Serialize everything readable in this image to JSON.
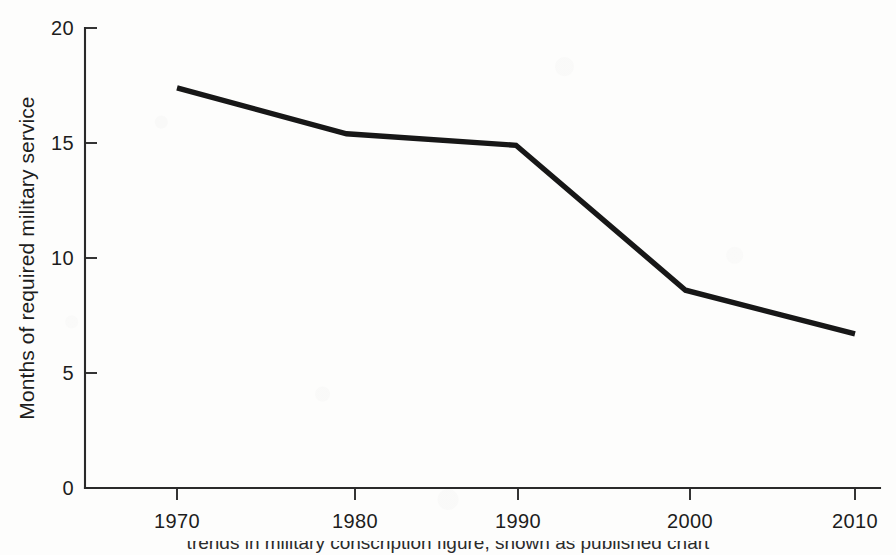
{
  "chart_data": {
    "type": "line",
    "title": "",
    "xlabel": "",
    "ylabel": "Months of required military service",
    "x": [
      1970,
      1980,
      1990,
      2000,
      2010
    ],
    "values": [
      17.4,
      15.4,
      14.9,
      8.6,
      6.7
    ],
    "categories": [
      "1970",
      "1980",
      "1990",
      "2000",
      "2010"
    ],
    "xtick_labels": [
      "1970",
      "1980",
      "1990",
      "2000",
      "2010"
    ],
    "ytick_labels": [
      "0",
      "5",
      "10",
      "15",
      "20"
    ],
    "ytick_values": [
      0,
      5,
      10,
      15,
      20
    ],
    "xlim": [
      1965,
      2015
    ],
    "ylim": [
      0,
      20
    ],
    "grid": false,
    "legend": false,
    "legend_position": "none",
    "line_color": "#171717",
    "axis_color": "#2a2a2a",
    "background_color": "#fdfdfc"
  },
  "axes": {
    "y_title": "Months of required military service",
    "y_ticks": [
      {
        "label": "20",
        "value": 20
      },
      {
        "label": "15",
        "value": 15
      },
      {
        "label": "10",
        "value": 10
      },
      {
        "label": "5",
        "value": 5
      },
      {
        "label": "0",
        "value": 0
      }
    ],
    "x_ticks": [
      {
        "label": "1970",
        "value": 1970
      },
      {
        "label": "1980",
        "value": 1980
      },
      {
        "label": "1990",
        "value": 1990
      },
      {
        "label": "2000",
        "value": 2000
      },
      {
        "label": "2010",
        "value": 2010
      }
    ]
  },
  "caption": {
    "text": "trends in military conscription figure, shown as published chart"
  }
}
